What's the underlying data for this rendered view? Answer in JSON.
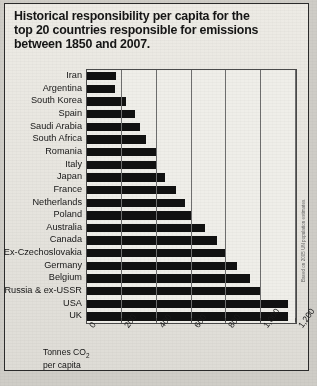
{
  "title": "Historical responsibility per capita for the\ntop 20 countries responsible for emissions\nbetween 1850 and 2007.",
  "axis_caption_line1": "Tonnes CO",
  "axis_caption_sub": "2",
  "axis_caption_line2": "per capita",
  "source_note": "Based on 2005 UN population estimates.",
  "colors": {
    "bar": "#111111",
    "panel_background": "#e9e7e1",
    "page_background": "#cfcdc7",
    "frame": "#4a4a4a",
    "text": "#151515"
  },
  "chart_data": {
    "type": "bar",
    "orientation": "horizontal",
    "title": "Historical responsibility per capita for the top 20 countries responsible for emissions between 1850 and 2007.",
    "xlabel": "Tonnes CO2 per capita",
    "ylabel": "",
    "xlim": [
      0,
      1200
    ],
    "xticks": [
      0,
      200,
      400,
      600,
      800,
      1000,
      1200
    ],
    "xtick_labels": [
      "0",
      "200",
      "400",
      "600",
      "800",
      "1,000",
      "1,200"
    ],
    "grid": true,
    "legend": false,
    "categories": [
      "Iran",
      "Argentina",
      "South Korea",
      "Spain",
      "Saudi Arabia",
      "South Africa",
      "Romania",
      "Italy",
      "Japan",
      "France",
      "Netherlands",
      "Poland",
      "Australia",
      "Canada",
      "Ex-Czechoslovakia",
      "Germany",
      "Belgium",
      "Russia & ex-USSR",
      "USA",
      "UK"
    ],
    "values": [
      165,
      160,
      225,
      275,
      305,
      340,
      395,
      400,
      445,
      510,
      560,
      600,
      675,
      745,
      790,
      860,
      935,
      1000,
      1155,
      1155
    ]
  }
}
